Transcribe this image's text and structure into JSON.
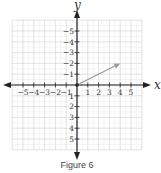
{
  "figure": {
    "caption": "Figure 6",
    "x_axis_label": "x",
    "y_axis_label": "y",
    "x_tick_labels": [
      "−5",
      "−4",
      "−3",
      "−2",
      "−1",
      "1",
      "2",
      "3",
      "4",
      "5"
    ],
    "y_tick_labels": [
      "5",
      "4",
      "3",
      "2",
      "1",
      "−1",
      "−2",
      "−3",
      "−4",
      "−5"
    ],
    "colors": {
      "axis": "#222222",
      "grid_major": "#cfcfcf",
      "grid_minor": "#ececec",
      "vector": "#9a9a9a"
    }
  },
  "chart_data": {
    "type": "scatter",
    "title": "Figure 6",
    "xlabel": "x",
    "ylabel": "y",
    "xlim": [
      -6,
      6
    ],
    "ylim": [
      -6,
      6
    ],
    "grid": true,
    "x_ticks": [
      -5,
      -4,
      -3,
      -2,
      -1,
      1,
      2,
      3,
      4,
      5
    ],
    "y_ticks": [
      -5,
      -4,
      -3,
      -2,
      -1,
      1,
      2,
      3,
      4,
      5
    ],
    "vectors": [
      {
        "start": [
          0,
          0
        ],
        "end": [
          4,
          2
        ],
        "label": "vector from origin to (4, 2)"
      }
    ]
  }
}
